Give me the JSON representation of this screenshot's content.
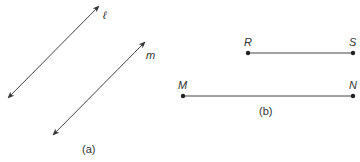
{
  "figure_a": {
    "caption": "(a)",
    "line_l_label": "ℓ",
    "line_m_label": "m"
  },
  "figure_b": {
    "caption": "(b)",
    "segment_rs": {
      "start_label": "R",
      "end_label": "S"
    },
    "segment_mn": {
      "start_label": "M",
      "end_label": "N"
    }
  },
  "colors": {
    "stroke": "#333333"
  }
}
